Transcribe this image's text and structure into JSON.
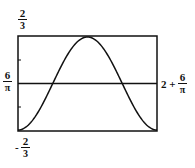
{
  "chart_data": {
    "type": "line",
    "title": "",
    "xlabel": "",
    "ylabel": "",
    "x_range_labels": {
      "min": "6/π",
      "max": "2 + 6/π"
    },
    "y_range_labels": {
      "min": "-2/3",
      "max": "2/3"
    },
    "xlim": [
      1.9099,
      3.9099
    ],
    "ylim": [
      -0.6667,
      0.6667
    ],
    "grid": false,
    "legend": null,
    "series": [
      {
        "name": "f(x)",
        "description": "One full period of a cosine wave: minimum at both ends, maximum at the center, crossing the x-axis at quarter points",
        "x": [
          1.9099,
          2.1599,
          2.4099,
          2.6599,
          2.9099,
          3.1599,
          3.4099,
          3.6599,
          3.9099
        ],
        "values": [
          -0.6667,
          -0.4714,
          0.0,
          0.4714,
          0.6667,
          0.4714,
          0.0,
          -0.4714,
          -0.6667
        ]
      }
    ],
    "reference_lines": [
      {
        "orientation": "horizontal",
        "y": 0
      }
    ]
  },
  "labels": {
    "y_top": {
      "num": "2",
      "den": "3"
    },
    "y_bottom": {
      "sign": "-",
      "num": "2",
      "den": "3"
    },
    "x_left": {
      "num": "6",
      "den": "π"
    },
    "x_right": {
      "prefix": "2 +",
      "num": "6",
      "den": "π"
    }
  }
}
